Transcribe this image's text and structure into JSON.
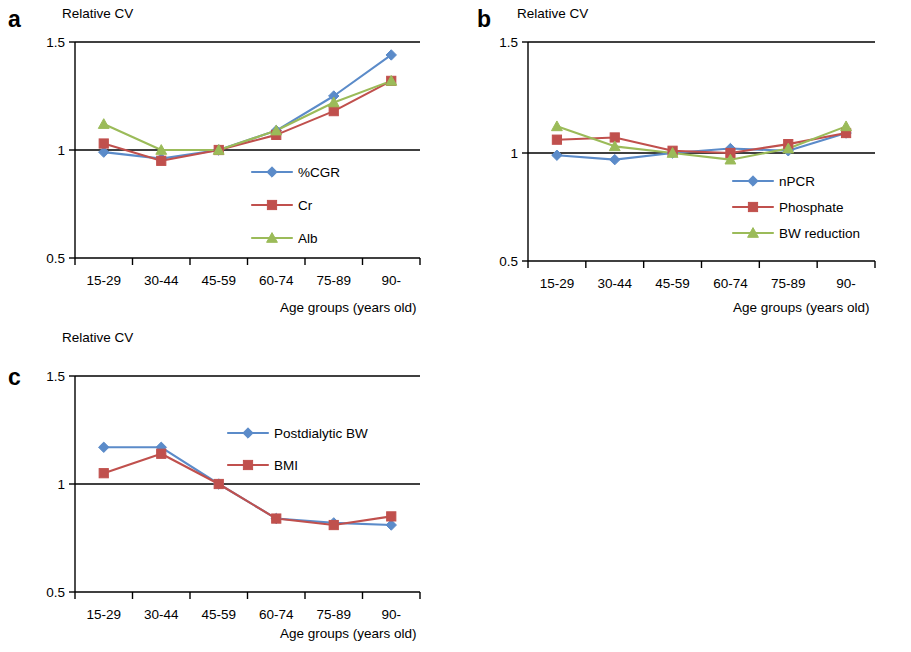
{
  "figure": {
    "panels": [
      {
        "id": "a",
        "letter": "a",
        "ylabel": "Relative CV",
        "xlabel": "Age groups (years old)"
      },
      {
        "id": "b",
        "letter": "b",
        "ylabel": "Relative CV",
        "xlabel": "Age groups (years old)"
      },
      {
        "id": "c",
        "letter": "c",
        "ylabel": "Relative CV",
        "xlabel": "Age groups (years old)"
      }
    ]
  },
  "colors": {
    "blue": "#5B8BC9",
    "red": "#C0504D",
    "green": "#9BBB59",
    "axis": "#000000"
  },
  "chart_data": [
    {
      "type": "line",
      "panel": "a",
      "title": "",
      "xlabel": "Age groups (years old)",
      "ylabel": "Relative CV",
      "categories": [
        "15-29",
        "30-44",
        "45-59",
        "60-74",
        "75-89",
        "90-"
      ],
      "ylim": [
        0.5,
        1.5
      ],
      "yticks": [
        0.5,
        1,
        1.5
      ],
      "ytick_labels": [
        "0.5",
        "1",
        "1.5"
      ],
      "grid": "horizontal gridlines at 0.5, 1 and 1.5",
      "legend_position": "inside center-right",
      "series": [
        {
          "name": "%CGR",
          "color": "#5B8BC9",
          "marker": "diamond",
          "values": [
            0.99,
            0.96,
            1.0,
            1.09,
            1.25,
            1.44
          ]
        },
        {
          "name": "Cr",
          "color": "#C0504D",
          "marker": "square",
          "values": [
            1.03,
            0.95,
            1.0,
            1.07,
            1.18,
            1.32
          ]
        },
        {
          "name": "Alb",
          "color": "#9BBB59",
          "marker": "triangle",
          "values": [
            1.12,
            1.0,
            1.0,
            1.09,
            1.22,
            1.32
          ]
        }
      ]
    },
    {
      "type": "line",
      "panel": "b",
      "title": "",
      "xlabel": "Age groups (years old)",
      "ylabel": "Relative CV",
      "categories": [
        "15-29",
        "30-44",
        "45-59",
        "60-74",
        "75-89",
        "90-"
      ],
      "ylim": [
        0.5,
        1.5
      ],
      "yticks": [
        0.5,
        1,
        1.5
      ],
      "ytick_labels": [
        "0.5",
        "1",
        "1.5"
      ],
      "grid": "horizontal gridlines at 0.5, 1 and 1.5",
      "legend_position": "inside center-right",
      "series": [
        {
          "name": "nPCR",
          "color": "#5B8BC9",
          "marker": "diamond",
          "values": [
            0.99,
            0.97,
            1.0,
            1.02,
            1.01,
            1.09
          ]
        },
        {
          "name": "Phosphate",
          "color": "#C0504D",
          "marker": "square",
          "values": [
            1.06,
            1.07,
            1.01,
            1.0,
            1.04,
            1.09
          ]
        },
        {
          "name": "BW reduction",
          "color": "#9BBB59",
          "marker": "triangle",
          "values": [
            1.12,
            1.03,
            1.0,
            0.97,
            1.02,
            1.12
          ]
        }
      ]
    },
    {
      "type": "line",
      "panel": "c",
      "title": "",
      "xlabel": "Age groups (years old)",
      "ylabel": "Relative CV",
      "categories": [
        "15-29",
        "30-44",
        "45-59",
        "60-74",
        "75-89",
        "90-"
      ],
      "ylim": [
        0.5,
        1.5
      ],
      "yticks": [
        0.5,
        1,
        1.5
      ],
      "ytick_labels": [
        "0.5",
        "1",
        "1.5"
      ],
      "grid": "horizontal gridlines at 0.5, 1 and 1.5",
      "legend_position": "inside top-right",
      "series": [
        {
          "name": "Postdialytic BW",
          "color": "#5B8BC9",
          "marker": "diamond",
          "values": [
            1.17,
            1.17,
            1.0,
            0.84,
            0.82,
            0.81
          ]
        },
        {
          "name": "BMI",
          "color": "#C0504D",
          "marker": "square",
          "values": [
            1.05,
            1.14,
            1.0,
            0.84,
            0.81,
            0.85
          ]
        }
      ]
    }
  ]
}
